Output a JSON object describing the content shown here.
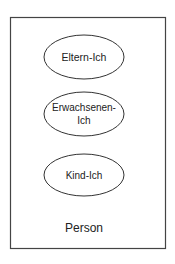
{
  "diagram": {
    "container": {
      "label": "Person",
      "x": 10,
      "y": 17,
      "width": 155,
      "height": 231,
      "stroke": "#444444"
    },
    "ellipses": [
      {
        "lines": [
          "Eltern-Ich"
        ],
        "cx": 84,
        "cy": 57,
        "rx": 40,
        "ry": 22
      },
      {
        "lines": [
          "Erwachsenen-",
          "Ich"
        ],
        "cx": 84,
        "cy": 114,
        "rx": 40,
        "ry": 22
      },
      {
        "lines": [
          "Kind-Ich"
        ],
        "cx": 84,
        "cy": 175,
        "rx": 40,
        "ry": 21
      }
    ],
    "stroke_color": "#333333",
    "text_color": "#222222"
  }
}
